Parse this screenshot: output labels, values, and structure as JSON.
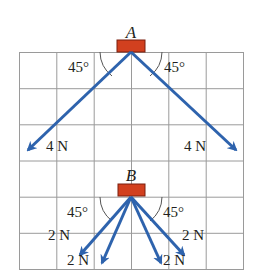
{
  "diagram": {
    "type": "force-vector-diagram",
    "colors": {
      "grid": "#9a9a9a",
      "arrow": "#2e63ad",
      "block": "#d2401f",
      "block_border": "#7a1f0f",
      "text": "#231f20"
    },
    "grid": {
      "columns": 6,
      "rows": 6
    },
    "case_a": {
      "label": "A",
      "angle_left": "45°",
      "angle_right": "45°",
      "forces": [
        {
          "label": "4 N",
          "direction": "down-left"
        },
        {
          "label": "4 N",
          "direction": "down-right"
        }
      ]
    },
    "case_b": {
      "label": "B",
      "angle_left": "45°",
      "angle_right": "45°",
      "forces": [
        {
          "label": "2 N",
          "direction": "down-left-outer"
        },
        {
          "label": "2 N",
          "direction": "down-left-inner"
        },
        {
          "label": "2 N",
          "direction": "down-right-inner"
        },
        {
          "label": "2 N",
          "direction": "down-right-outer"
        }
      ]
    }
  }
}
